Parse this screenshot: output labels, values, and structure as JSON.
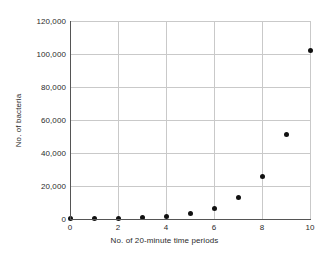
{
  "chart_data": {
    "type": "scatter",
    "title": "",
    "xlabel": "No. of 20-minute time periods",
    "ylabel": "No. of bacteria",
    "x": [
      0,
      1,
      2,
      3,
      4,
      5,
      6,
      7,
      8,
      9,
      10
    ],
    "values": [
      100,
      200,
      400,
      800,
      1600,
      3200,
      6400,
      12800,
      25600,
      51200,
      102400
    ],
    "series": [
      {
        "name": "No. of bacteria",
        "values": [
          100,
          200,
          400,
          800,
          1600,
          3200,
          6400,
          12800,
          25600,
          51200,
          102400
        ]
      }
    ],
    "xlim": [
      0,
      10
    ],
    "ylim": [
      0,
      120000
    ],
    "xticks": [
      0,
      2,
      4,
      6,
      8,
      10
    ],
    "xtick_labels": [
      "0",
      "2",
      "4",
      "6",
      "8",
      "10"
    ],
    "yticks": [
      0,
      20000,
      40000,
      60000,
      80000,
      100000,
      120000
    ],
    "ytick_labels": [
      "0",
      "20,000",
      "40,000",
      "60,000",
      "80,000",
      "100,000",
      "120,000"
    ],
    "grid": true,
    "legend": false,
    "marker": "filled-circle",
    "marker_color": "#111111",
    "grid_color": "#c9c9c9",
    "axis_color": "#555555",
    "background_color": "#ffffff"
  }
}
